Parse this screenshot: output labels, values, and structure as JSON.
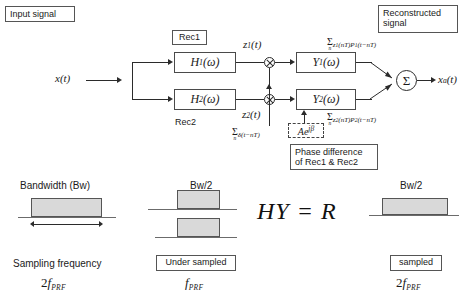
{
  "annotations": {
    "input_signal": "Input signal",
    "reconstructed_signal": "Reconstructed\nsignal",
    "rec1": "Rec1",
    "rec2": "Rec2",
    "phase_difference": "Phase difference\nof Rec1 & Rec2"
  },
  "blocks": {
    "h1": {
      "name": "H",
      "sub": "1",
      "arg": "(ω)"
    },
    "h2": {
      "name": "H",
      "sub": "2",
      "arg": "(ω)"
    },
    "y1": {
      "name": "Y",
      "sub": "1",
      "arg": "(ω)"
    },
    "y2": {
      "name": "Y",
      "sub": "2",
      "arg": "(ω)"
    }
  },
  "signals": {
    "input": "x(t)",
    "input_name": "x",
    "input_arg": "(t)",
    "z1": "z",
    "z1_sub": "1",
    "z1_arg": "(t)",
    "z2": "z",
    "z2_sub": "2",
    "z2_arg": "(t)",
    "output": "x",
    "output_sub": "a",
    "output_arg": "(t)"
  },
  "formulas": {
    "sum_symbol": "Σ",
    "sum_index": "n",
    "branch1": "z₁(nT)P₁(t−nT)",
    "branch1_parts": {
      "z": "z",
      "zsub": "1",
      "mid": "(nT)P",
      "psub": "1",
      "tail": "(t−nT)"
    },
    "branch2_parts": {
      "z": "z",
      "zsub": "2",
      "mid": "(nT)P",
      "psub": "2",
      "tail": "(t−nT)"
    },
    "delta_train": "δ(t−nT)",
    "phase_term": "Ae",
    "phase_exp": "jβ",
    "identity": "HY = R"
  },
  "bandwidth": {
    "col1": {
      "title": "Bandwidth (Bw)",
      "caption": "Sampling frequency",
      "rate_coef": "2",
      "rate_f": "f",
      "rate_sub": "PRF"
    },
    "col2": {
      "title": "Bw/2",
      "caption": "Under sampled",
      "rate_coef": "",
      "rate_f": "f",
      "rate_sub": "PRF"
    },
    "col3": {
      "title": "Bw/2",
      "caption": "sampled",
      "rate_coef": "2",
      "rate_f": "f",
      "rate_sub": "PRF"
    }
  },
  "colors": {
    "rect_fill": "#d9d9d9",
    "rect_stroke": "#555555",
    "line": "#2b2b2b",
    "baseline": "#6b6b6b"
  }
}
